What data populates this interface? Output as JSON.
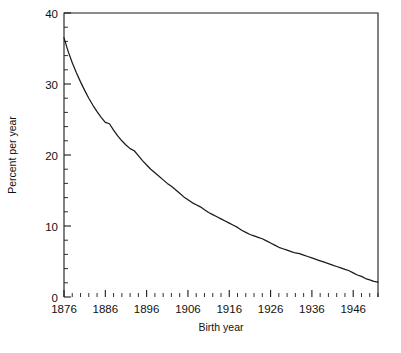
{
  "chart_data": {
    "type": "line",
    "title": "",
    "xlabel": "Birth year",
    "ylabel": "Percent per year",
    "xlim": [
      1876,
      1952
    ],
    "ylim": [
      0,
      40
    ],
    "grid": false,
    "legend": null,
    "x_major_ticks": [
      1876,
      1886,
      1896,
      1906,
      1916,
      1926,
      1936,
      1946
    ],
    "x_tick_labels": [
      "1876",
      "1886",
      "1896",
      "1906",
      "1916",
      "1926",
      "1936",
      "1946"
    ],
    "x_minor_step": 2,
    "y_major_ticks": [
      0,
      10,
      20,
      30,
      40
    ],
    "y_tick_labels": [
      "0",
      "10",
      "20",
      "30",
      "40"
    ],
    "y_minor_step": 2,
    "series": [
      {
        "name": "Percent per year",
        "x": [
          1876,
          1877,
          1878,
          1879,
          1880,
          1881,
          1882,
          1883,
          1884,
          1885,
          1886,
          1887,
          1888,
          1889,
          1890,
          1891,
          1892,
          1893,
          1894,
          1895,
          1896,
          1897,
          1898,
          1899,
          1900,
          1901,
          1902,
          1903,
          1904,
          1905,
          1906,
          1907,
          1908,
          1909,
          1910,
          1911,
          1912,
          1913,
          1914,
          1915,
          1916,
          1917,
          1918,
          1919,
          1920,
          1921,
          1922,
          1923,
          1924,
          1925,
          1926,
          1927,
          1928,
          1929,
          1930,
          1931,
          1932,
          1933,
          1934,
          1935,
          1936,
          1937,
          1938,
          1939,
          1940,
          1941,
          1942,
          1943,
          1944,
          1945,
          1946,
          1947,
          1948,
          1949,
          1950,
          1951,
          1952
        ],
        "values": [
          36.5,
          34.6,
          33.0,
          31.6,
          30.3,
          29.1,
          28.0,
          27.0,
          26.1,
          25.3,
          24.6,
          24.4,
          23.5,
          22.7,
          22.0,
          21.4,
          20.9,
          20.6,
          19.9,
          19.2,
          18.6,
          18.0,
          17.5,
          17.0,
          16.5,
          16.0,
          15.6,
          15.1,
          14.6,
          14.1,
          13.7,
          13.3,
          13.0,
          12.7,
          12.3,
          11.9,
          11.6,
          11.3,
          11.0,
          10.7,
          10.4,
          10.1,
          9.8,
          9.4,
          9.1,
          8.8,
          8.6,
          8.4,
          8.2,
          7.9,
          7.6,
          7.3,
          7.0,
          6.8,
          6.6,
          6.4,
          6.2,
          6.1,
          5.9,
          5.7,
          5.5,
          5.3,
          5.1,
          4.9,
          4.7,
          4.5,
          4.3,
          4.1,
          3.9,
          3.7,
          3.4,
          3.1,
          2.9,
          2.6,
          2.4,
          2.2,
          2.1
        ]
      }
    ]
  }
}
